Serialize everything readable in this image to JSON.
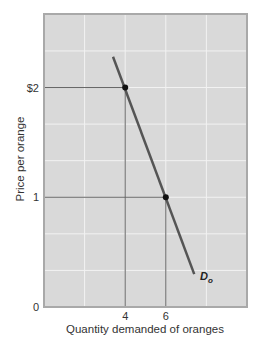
{
  "chart_data": {
    "type": "line",
    "title": "",
    "xlabel": "Quantity demanded of oranges",
    "ylabel": "Price per orange",
    "xlim": [
      0,
      10
    ],
    "ylim": [
      0,
      2.67
    ],
    "grid": true,
    "x_ticks": [
      {
        "value": 4,
        "label": "4"
      },
      {
        "value": 6,
        "label": "6"
      }
    ],
    "y_ticks": [
      {
        "value": 0,
        "label": "0"
      },
      {
        "value": 1,
        "label": "1"
      },
      {
        "value": 2,
        "label": "$2"
      }
    ],
    "series": [
      {
        "name": "Do",
        "label_main": "D",
        "label_sub": "o",
        "points": [
          {
            "x": 3.4,
            "y": 2.28
          },
          {
            "x": 7.4,
            "y": 0.3
          }
        ]
      }
    ],
    "highlighted_points": [
      {
        "x": 4,
        "y": 2
      },
      {
        "x": 6,
        "y": 1
      }
    ],
    "colors": {
      "plot_background": "#d9d9d9",
      "grid": "#f2f2f2",
      "frame": "#a9a9a9",
      "curve": "#555555",
      "guide_lines": "#666666",
      "points": "#111111"
    }
  }
}
